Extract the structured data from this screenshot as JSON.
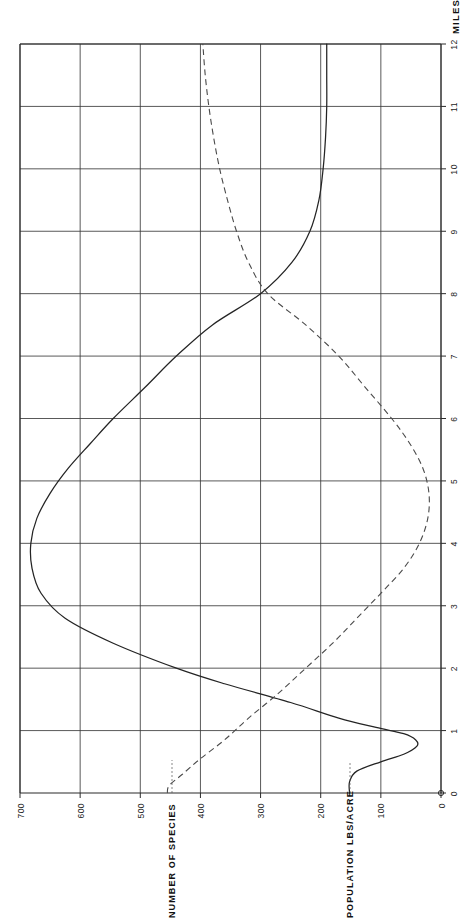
{
  "figure": {
    "orientation": "rotated-90",
    "background": "#ffffff",
    "ink_color": "#242424"
  },
  "chart_data": {
    "type": "line",
    "title": "",
    "subtitle": "",
    "xlabel": "MILES",
    "ylabel": "",
    "xlim": [
      0,
      12
    ],
    "ylim": [
      0,
      700
    ],
    "grid": true,
    "legend_position": "none",
    "x_tick_labels": [
      "0",
      "1",
      "2",
      "3",
      "4",
      "5",
      "6",
      "7",
      "8",
      "9",
      "10",
      "11",
      "12"
    ],
    "x_ticks": [
      0,
      1,
      2,
      3,
      4,
      5,
      6,
      7,
      8,
      9,
      10,
      11,
      12
    ],
    "y_tick_labels": [
      "0",
      "100",
      "200",
      "300",
      "400",
      "500",
      "600",
      "700"
    ],
    "y_ticks": [
      0,
      100,
      200,
      300,
      400,
      500,
      600,
      700
    ],
    "series": [
      {
        "name": "POPULATION LBS/ACRE",
        "style": "solid",
        "color": "#242424",
        "x": [
          0.0,
          0.18,
          0.35,
          0.5,
          0.62,
          0.75,
          0.85,
          0.95,
          1.05,
          1.2,
          1.45,
          1.75,
          2.0,
          2.4,
          2.8,
          3.2,
          3.6,
          4.0,
          4.4,
          4.8,
          5.2,
          5.6,
          6.0,
          6.5,
          7.0,
          7.5,
          8.0,
          8.5,
          9.0,
          9.5,
          10.0,
          10.5,
          11.0,
          11.5,
          12.0
        ],
        "y": [
          152,
          152,
          140,
          100,
          62,
          40,
          42,
          62,
          108,
          170,
          250,
          360,
          440,
          545,
          625,
          665,
          680,
          682,
          672,
          650,
          620,
          583,
          545,
          492,
          440,
          380,
          300,
          248,
          218,
          203,
          196,
          192,
          190,
          190,
          190
        ]
      },
      {
        "name": "NUMBER OF SPECIES",
        "style": "dashed",
        "color": "#4a4a4a",
        "x": [
          0.0,
          0.12,
          0.3,
          0.55,
          0.85,
          1.2,
          1.6,
          2.0,
          2.4,
          2.8,
          3.2,
          3.6,
          4.0,
          4.4,
          4.8,
          5.2,
          5.6,
          6.0,
          6.5,
          7.0,
          7.5,
          8.0,
          8.5,
          9.0,
          9.5,
          10.0,
          10.5,
          11.0,
          11.5,
          12.0
        ],
        "y": [
          455,
          452,
          430,
          400,
          360,
          320,
          270,
          225,
          180,
          140,
          100,
          62,
          36,
          22,
          20,
          30,
          52,
          82,
          126,
          170,
          225,
          288,
          320,
          340,
          355,
          368,
          378,
          386,
          392,
          396
        ]
      }
    ],
    "annotations": [
      {
        "text": "NUMBER OF SPECIES",
        "anchored_to_value": 455,
        "axis": "y"
      },
      {
        "text": "POPULATION LBS/ACRE",
        "anchored_to_value": 152,
        "axis": "y"
      },
      {
        "text": "MILES",
        "axis": "x"
      }
    ]
  },
  "axis": {
    "miles_title": "MILES",
    "miles_ticks": [
      "0",
      "1",
      "2",
      "3",
      "4",
      "5",
      "6",
      "7",
      "8",
      "9",
      "10",
      "11",
      "12"
    ],
    "value_ticks": [
      "700",
      "600",
      "500",
      "400",
      "300",
      "200",
      "100",
      "0"
    ],
    "series_label_species": "NUMBER OF SPECIES",
    "series_label_population": "POPULATION LBS/ACRE"
  }
}
